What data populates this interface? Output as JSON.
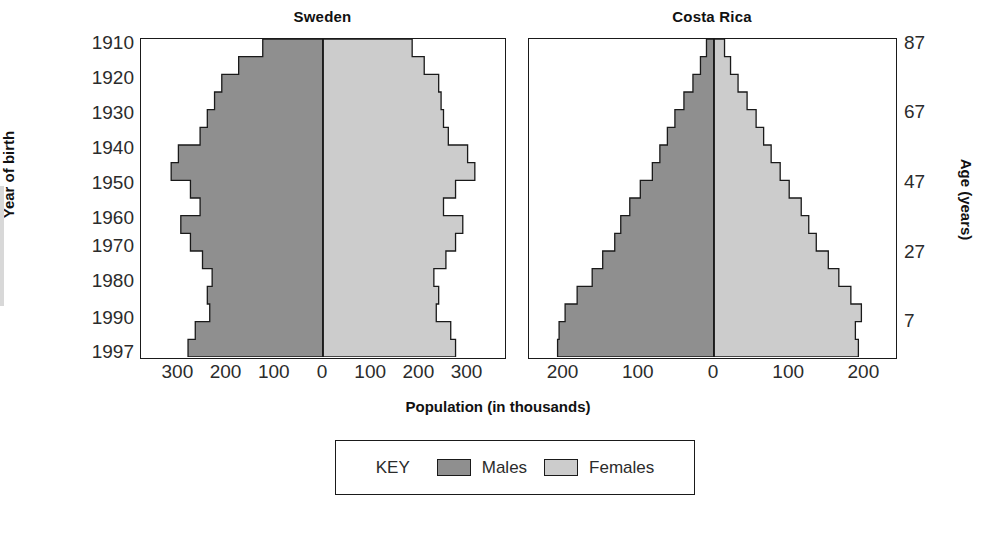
{
  "colors": {
    "males": "#8f8f8f",
    "females": "#cccccc",
    "outline": "#1a1a1a",
    "background": "#ffffff",
    "text": "#1a1a1a"
  },
  "axis_titles": {
    "y_left": "Year of birth",
    "y_right": "Age (years)",
    "x_bottom": "Population (in thousands)"
  },
  "legend": {
    "key_label": "KEY",
    "males_label": "Males",
    "females_label": "Females"
  },
  "panels": [
    {
      "title": "Sweden",
      "year_ticks": [
        "1910",
        "1920",
        "1930",
        "1940",
        "1950",
        "1960",
        "1970",
        "1980",
        "1990",
        "1997"
      ],
      "x_ticks": [
        "300",
        "200",
        "100",
        "0",
        "100",
        "200",
        "300"
      ],
      "x_tick_values": [
        -300,
        -200,
        -100,
        0,
        100,
        200,
        300
      ],
      "xlim": [
        -380,
        380
      ]
    },
    {
      "title": "Costa Rica",
      "age_ticks": [
        "87",
        "67",
        "47",
        "27",
        "7"
      ],
      "age_tick_values": [
        87,
        67,
        47,
        27,
        7
      ],
      "x_ticks": [
        "200",
        "100",
        "0",
        "100",
        "200"
      ],
      "x_tick_values": [
        -200,
        -100,
        0,
        100,
        200
      ],
      "xlim": [
        -245,
        245
      ]
    }
  ],
  "chart_data": [
    {
      "type": "bar",
      "orientation": "horizontal-pyramid",
      "title": "Sweden",
      "xlabel": "Population (in thousands)",
      "ylabel": "Year of birth",
      "ylim_years": [
        1910,
        1997
      ],
      "xlim": [
        -380,
        380
      ],
      "grid": false,
      "legend_position": "bottom",
      "categories": [
        "1910-1914",
        "1915-1919",
        "1920-1924",
        "1925-1929",
        "1930-1934",
        "1935-1939",
        "1940-1944",
        "1945-1949",
        "1950-1954",
        "1955-1959",
        "1960-1964",
        "1965-1969",
        "1970-1974",
        "1975-1979",
        "1980-1984",
        "1985-1989",
        "1990-1994",
        "1995-1997"
      ],
      "series": [
        {
          "name": "Males",
          "values": [
            125,
            175,
            210,
            225,
            240,
            255,
            300,
            315,
            275,
            255,
            295,
            275,
            250,
            230,
            240,
            235,
            265,
            280
          ]
        },
        {
          "name": "Females",
          "values": [
            185,
            210,
            240,
            245,
            250,
            260,
            300,
            315,
            275,
            250,
            290,
            275,
            255,
            230,
            240,
            235,
            265,
            275
          ]
        }
      ]
    },
    {
      "type": "bar",
      "orientation": "horizontal-pyramid",
      "title": "Costa Rica",
      "xlabel": "Population (in thousands)",
      "ylabel": "Age (years)",
      "ylim_age": [
        2,
        87
      ],
      "xlim": [
        -245,
        245
      ],
      "grid": false,
      "legend_position": "bottom",
      "categories": [
        "85+",
        "80-84",
        "75-79",
        "70-74",
        "65-69",
        "60-64",
        "55-59",
        "50-54",
        "45-49",
        "40-44",
        "35-39",
        "30-34",
        "25-29",
        "20-24",
        "15-19",
        "10-14",
        "5-9",
        "0-4"
      ],
      "series": [
        {
          "name": "Males",
          "values": [
            10,
            18,
            28,
            40,
            52,
            62,
            72,
            82,
            98,
            112,
            124,
            132,
            148,
            162,
            182,
            198,
            206,
            208
          ]
        },
        {
          "name": "Females",
          "values": [
            14,
            22,
            32,
            44,
            56,
            66,
            76,
            88,
            100,
            116,
            126,
            136,
            152,
            166,
            182,
            196,
            188,
            192
          ]
        }
      ]
    }
  ]
}
